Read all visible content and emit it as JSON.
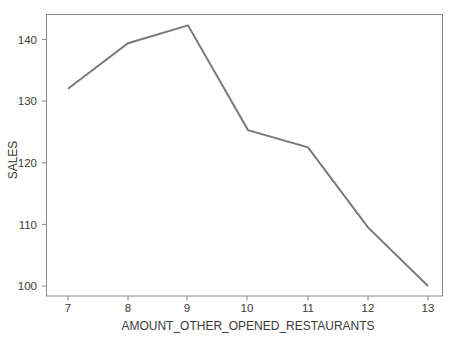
{
  "chart_data": {
    "type": "line",
    "title": "",
    "subtitle": "",
    "xlabel": "AMOUNT_OTHER_OPENED_RESTAURANTS",
    "ylabel": "SALES",
    "x": [
      7,
      8,
      9,
      10,
      11,
      12,
      13
    ],
    "values": [
      132.0,
      139.4,
      142.3,
      125.3,
      122.5,
      109.5,
      100.0
    ],
    "series": [
      {
        "name": "SALES",
        "values": [
          132.0,
          139.4,
          142.3,
          125.3,
          122.5,
          109.5,
          100.0
        ]
      }
    ],
    "x_tick_labels": [
      "7",
      "8",
      "9",
      "10",
      "11",
      "12",
      "13"
    ],
    "y_tick_labels": [
      "100",
      "110",
      "120",
      "130",
      "140"
    ],
    "y_tick_values": [
      100,
      110,
      120,
      130,
      140
    ],
    "xlim": [
      6.65,
      13.27
    ],
    "ylim": [
      98.4,
      143.9
    ],
    "grid": false,
    "legend": false,
    "legend_position": "none",
    "annotations": [],
    "colors": {
      "line": "#7a7a7a",
      "axis": "#8a8a8a",
      "text": "#3a3a3a",
      "background": "#ffffff"
    }
  }
}
